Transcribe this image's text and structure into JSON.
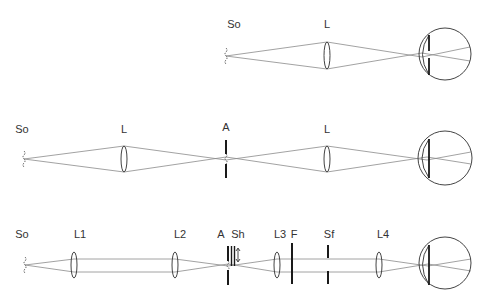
{
  "diagram": {
    "rows": [
      {
        "id": "row1-simple-lens",
        "labels": [
          {
            "text": "So",
            "x": 234,
            "y": 19
          },
          {
            "text": "L",
            "x": 327,
            "y": 19
          }
        ],
        "source": {
          "x": 226,
          "y": 56
        },
        "elements": [
          {
            "type": "lens",
            "label": "L",
            "x": 327,
            "y1": 42,
            "y2": 69
          }
        ],
        "eye": {
          "cx": 445,
          "cy": 54,
          "r": 26,
          "iris_x": 429,
          "iris_y1": 35,
          "iris_y2": 75
        }
      },
      {
        "id": "row2-aperture-relay",
        "labels": [
          {
            "text": "So",
            "x": 22,
            "y": 124
          },
          {
            "text": "L",
            "x": 124,
            "y": 124
          },
          {
            "text": "A",
            "x": 226,
            "y": 122
          },
          {
            "text": "L",
            "x": 327,
            "y": 124
          }
        ],
        "source": {
          "x": 24,
          "y": 159
        },
        "elements": [
          {
            "type": "lens",
            "label": "L",
            "x": 124,
            "y1": 146,
            "y2": 172
          },
          {
            "type": "aperture",
            "label": "A",
            "x": 226,
            "y1": 140,
            "y2": 178
          },
          {
            "type": "lens",
            "label": "L",
            "x": 327,
            "y1": 146,
            "y2": 172
          }
        ],
        "eye": {
          "cx": 445,
          "cy": 158,
          "r": 27,
          "iris_x": 429,
          "iris_y1": 139,
          "iris_y2": 178
        }
      },
      {
        "id": "row3-maxwellian-view",
        "labels": [
          {
            "text": "So",
            "x": 22,
            "y": 229
          },
          {
            "text": "L1",
            "x": 80,
            "y": 229
          },
          {
            "text": "L2",
            "x": 180,
            "y": 229
          },
          {
            "text": "A",
            "x": 220,
            "y": 229
          },
          {
            "text": "Sh",
            "x": 236,
            "y": 229
          },
          {
            "text": "L3",
            "x": 280,
            "y": 229
          },
          {
            "text": "F",
            "x": 293,
            "y": 229
          },
          {
            "text": "Sf",
            "x": 329,
            "y": 229
          },
          {
            "text": "L4",
            "x": 383,
            "y": 229
          }
        ],
        "source": {
          "x": 25,
          "y": 265
        },
        "elements": [
          {
            "type": "lens",
            "label": "L1",
            "x": 74,
            "y1": 252,
            "y2": 278
          },
          {
            "type": "lens",
            "label": "L2",
            "x": 175,
            "y1": 252,
            "y2": 278
          },
          {
            "type": "aperture",
            "label": "A",
            "x": 228,
            "y1": 246,
            "y2": 285
          },
          {
            "type": "shutter",
            "label": "Sh",
            "x": 232,
            "y1": 246,
            "y2": 266
          },
          {
            "type": "lens",
            "label": "L3",
            "x": 277,
            "y1": 252,
            "y2": 278
          },
          {
            "type": "filter",
            "label": "F",
            "x": 292,
            "y1": 243,
            "y2": 284
          },
          {
            "type": "field-stop",
            "label": "Sf",
            "x": 328,
            "y1": 245,
            "y2": 284
          },
          {
            "type": "lens",
            "label": "L4",
            "x": 379,
            "y1": 252,
            "y2": 278
          }
        ],
        "eye": {
          "cx": 445,
          "cy": 263,
          "r": 26,
          "iris_x": 429,
          "iris_y1": 245,
          "iris_y2": 285
        }
      }
    ],
    "legend_symbols": {
      "So": "light source",
      "L": "lens",
      "A": "aperture",
      "Sh": "shutter",
      "F": "filter",
      "Sf": "field stop"
    }
  }
}
